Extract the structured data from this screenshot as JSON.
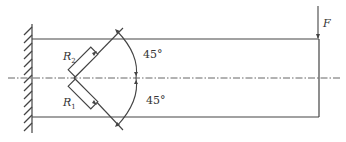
{
  "diagram": {
    "type": "cantilever beam with strain gauges",
    "labels": {
      "force": "F",
      "gauge_top": "R",
      "gauge_top_sub": "2",
      "gauge_bottom": "R",
      "gauge_bottom_sub": "1",
      "angle_top": "45°",
      "angle_bottom": "45°"
    },
    "colors": {
      "line": "#444444",
      "background": "#ffffff"
    }
  }
}
